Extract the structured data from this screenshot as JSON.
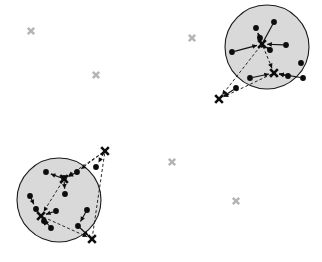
{
  "figure": {
    "type": "cluster-scatter-diagram",
    "width": 322,
    "height": 262,
    "background_color": "#ffffff",
    "title": ""
  },
  "chart_data": {
    "type": "scatter",
    "title": "",
    "xlabel": "",
    "ylabel": "",
    "xlim": [
      0,
      322
    ],
    "ylim": [
      0,
      262
    ],
    "grid": false,
    "legend": null,
    "colors": {
      "cluster_fill": "#d9d9d9",
      "cluster_stroke": "#1a1a1a",
      "node": "#0d0d0d",
      "marker_dark": "#0d0d0d",
      "marker_gray": "#b4b4b4",
      "edge": "#111111",
      "background": "#ffffff"
    },
    "clusters": [
      {
        "name": "cluster-top-right",
        "center": [
          267,
          47
        ],
        "radius": 42
      },
      {
        "name": "cluster-bottom-left",
        "center": [
          59,
          200
        ],
        "radius": 42
      }
    ],
    "series": [
      {
        "name": "nodes",
        "marker": "filled-circle",
        "points": [
          [
            274,
            22
          ],
          [
            256,
            28
          ],
          [
            260,
            38
          ],
          [
            286,
            45
          ],
          [
            270,
            50
          ],
          [
            232,
            52
          ],
          [
            301,
            63
          ],
          [
            288,
            76
          ],
          [
            250,
            78
          ],
          [
            236,
            88
          ],
          [
            303,
            78
          ],
          [
            46,
            172
          ],
          [
            77,
            172
          ],
          [
            64,
            178
          ],
          [
            65,
            194
          ],
          [
            30,
            196
          ],
          [
            36,
            209
          ],
          [
            56,
            211
          ],
          [
            44,
            221
          ],
          [
            51,
            228
          ],
          [
            87,
            210
          ],
          [
            78,
            226
          ],
          [
            96,
            167
          ]
        ]
      },
      {
        "name": "centroid-markers-dark",
        "marker": "x",
        "points": [
          [
            262,
            44
          ],
          [
            274,
            73
          ],
          [
            219,
            99
          ],
          [
            64,
            179
          ],
          [
            41,
            216
          ],
          [
            105,
            151
          ],
          [
            92,
            239
          ]
        ]
      },
      {
        "name": "outlier-markers-gray",
        "marker": "x",
        "points": [
          [
            31,
            31
          ],
          [
            96,
            75
          ],
          [
            192,
            38
          ],
          [
            172,
            162
          ],
          [
            236,
            201
          ]
        ]
      }
    ],
    "edges": [
      {
        "from": [
          262,
          44
        ],
        "to": [
          274,
          22
        ],
        "style": "solid",
        "arrow": false
      },
      {
        "from": [
          262,
          44
        ],
        "to": [
          256,
          28
        ],
        "style": "solid",
        "arrow": true
      },
      {
        "from": [
          262,
          44
        ],
        "to": [
          260,
          38
        ],
        "style": "solid",
        "arrow": true
      },
      {
        "from": [
          286,
          45
        ],
        "to": [
          262,
          44
        ],
        "style": "solid",
        "arrow": true
      },
      {
        "from": [
          270,
          50
        ],
        "to": [
          262,
          44
        ],
        "style": "solid",
        "arrow": true
      },
      {
        "from": [
          232,
          52
        ],
        "to": [
          262,
          44
        ],
        "style": "solid",
        "arrow": true
      },
      {
        "from": [
          262,
          44
        ],
        "to": [
          274,
          73
        ],
        "style": "dashed",
        "arrow": true
      },
      {
        "from": [
          262,
          44
        ],
        "to": [
          219,
          99
        ],
        "style": "dashed",
        "arrow": true
      },
      {
        "from": [
          274,
          73
        ],
        "to": [
          219,
          99
        ],
        "style": "dashed",
        "arrow": true
      },
      {
        "from": [
          303,
          78
        ],
        "to": [
          274,
          73
        ],
        "style": "solid",
        "arrow": true
      },
      {
        "from": [
          288,
          76
        ],
        "to": [
          274,
          73
        ],
        "style": "solid",
        "arrow": true
      },
      {
        "from": [
          250,
          78
        ],
        "to": [
          274,
          73
        ],
        "style": "solid",
        "arrow": true
      },
      {
        "from": [
          236,
          88
        ],
        "to": [
          219,
          99
        ],
        "style": "solid",
        "arrow": true
      },
      {
        "from": [
          64,
          179
        ],
        "to": [
          46,
          172
        ],
        "style": "solid",
        "arrow": true
      },
      {
        "from": [
          77,
          172
        ],
        "to": [
          64,
          179
        ],
        "style": "solid",
        "arrow": true
      },
      {
        "from": [
          64,
          179
        ],
        "to": [
          65,
          194
        ],
        "style": "solid",
        "arrow": true
      },
      {
        "from": [
          105,
          151
        ],
        "to": [
          64,
          179
        ],
        "style": "dashed",
        "arrow": true
      },
      {
        "from": [
          105,
          151
        ],
        "to": [
          96,
          167
        ],
        "style": "dashed",
        "arrow": true
      },
      {
        "from": [
          105,
          151
        ],
        "to": [
          77,
          172
        ],
        "style": "dashed",
        "arrow": true
      },
      {
        "from": [
          64,
          179
        ],
        "to": [
          41,
          216
        ],
        "style": "dashed",
        "arrow": true
      },
      {
        "from": [
          30,
          196
        ],
        "to": [
          36,
          209
        ],
        "style": "solid",
        "arrow": true
      },
      {
        "from": [
          36,
          209
        ],
        "to": [
          41,
          216
        ],
        "style": "solid",
        "arrow": true
      },
      {
        "from": [
          56,
          211
        ],
        "to": [
          41,
          216
        ],
        "style": "solid",
        "arrow": true
      },
      {
        "from": [
          44,
          221
        ],
        "to": [
          41,
          216
        ],
        "style": "solid",
        "arrow": true
      },
      {
        "from": [
          51,
          228
        ],
        "to": [
          41,
          216
        ],
        "style": "solid",
        "arrow": true
      },
      {
        "from": [
          41,
          216
        ],
        "to": [
          92,
          239
        ],
        "style": "dashed",
        "arrow": true
      },
      {
        "from": [
          87,
          210
        ],
        "to": [
          78,
          226
        ],
        "style": "solid",
        "arrow": true
      },
      {
        "from": [
          78,
          226
        ],
        "to": [
          92,
          239
        ],
        "style": "solid",
        "arrow": true
      },
      {
        "from": [
          105,
          151
        ],
        "to": [
          92,
          239
        ],
        "style": "dashed",
        "arrow": false
      }
    ]
  }
}
